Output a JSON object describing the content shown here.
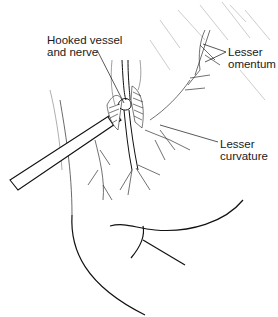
{
  "figure": {
    "type": "surgical illustration",
    "labels": {
      "hooked_vessel": [
        "Hooked vessel",
        "and nerve"
      ],
      "lesser_omentum": [
        "Lesser",
        "omentum"
      ],
      "lesser_curvature": [
        "Lesser",
        "curvature"
      ]
    },
    "colors": {
      "ink": "#1a1a1a",
      "background": "#ffffff",
      "hatch": "#555555"
    }
  }
}
